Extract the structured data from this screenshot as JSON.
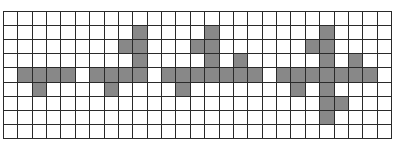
{
  "grid": {
    "rows": 9,
    "cols": 27,
    "fill_color": "#888888",
    "empty_color": "#ffffff",
    "line_color": "#2a2a2a",
    "filled_cells": [
      [
        1,
        9
      ],
      [
        1,
        14
      ],
      [
        1,
        22
      ],
      [
        2,
        8
      ],
      [
        2,
        9
      ],
      [
        2,
        13
      ],
      [
        2,
        14
      ],
      [
        2,
        21
      ],
      [
        2,
        22
      ],
      [
        3,
        9
      ],
      [
        3,
        14
      ],
      [
        3,
        16
      ],
      [
        3,
        22
      ],
      [
        3,
        24
      ],
      [
        4,
        1
      ],
      [
        4,
        2
      ],
      [
        4,
        3
      ],
      [
        4,
        4
      ],
      [
        4,
        6
      ],
      [
        4,
        7
      ],
      [
        4,
        8
      ],
      [
        4,
        9
      ],
      [
        4,
        11
      ],
      [
        4,
        12
      ],
      [
        4,
        13
      ],
      [
        4,
        14
      ],
      [
        4,
        15
      ],
      [
        4,
        16
      ],
      [
        4,
        17
      ],
      [
        4,
        19
      ],
      [
        4,
        20
      ],
      [
        4,
        21
      ],
      [
        4,
        22
      ],
      [
        4,
        23
      ],
      [
        4,
        24
      ],
      [
        4,
        25
      ],
      [
        5,
        2
      ],
      [
        5,
        7
      ],
      [
        5,
        12
      ],
      [
        5,
        20
      ],
      [
        5,
        22
      ],
      [
        6,
        22
      ],
      [
        6,
        23
      ],
      [
        7,
        22
      ]
    ],
    "shapes": [
      {
        "name": "shape-1",
        "cells": [
          [
            4,
            1
          ],
          [
            4,
            2
          ],
          [
            4,
            3
          ],
          [
            4,
            4
          ],
          [
            5,
            2
          ]
        ]
      },
      {
        "name": "shape-2",
        "cells": [
          [
            1,
            9
          ],
          [
            2,
            8
          ],
          [
            2,
            9
          ],
          [
            3,
            9
          ],
          [
            4,
            6
          ],
          [
            4,
            7
          ],
          [
            4,
            8
          ],
          [
            4,
            9
          ],
          [
            5,
            7
          ]
        ]
      },
      {
        "name": "shape-3",
        "cells": [
          [
            1,
            14
          ],
          [
            2,
            13
          ],
          [
            2,
            14
          ],
          [
            3,
            14
          ],
          [
            3,
            16
          ],
          [
            4,
            11
          ],
          [
            4,
            12
          ],
          [
            4,
            13
          ],
          [
            4,
            14
          ],
          [
            4,
            15
          ],
          [
            4,
            16
          ],
          [
            4,
            17
          ],
          [
            5,
            12
          ]
        ]
      },
      {
        "name": "shape-4",
        "cells": [
          [
            1,
            22
          ],
          [
            2,
            21
          ],
          [
            2,
            22
          ],
          [
            3,
            22
          ],
          [
            3,
            24
          ],
          [
            4,
            19
          ],
          [
            4,
            20
          ],
          [
            4,
            21
          ],
          [
            4,
            22
          ],
          [
            4,
            23
          ],
          [
            4,
            24
          ],
          [
            4,
            25
          ],
          [
            5,
            20
          ],
          [
            5,
            22
          ],
          [
            6,
            22
          ],
          [
            6,
            23
          ],
          [
            7,
            22
          ]
        ]
      }
    ]
  }
}
